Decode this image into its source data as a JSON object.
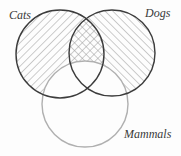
{
  "diagram": {
    "type": "venn",
    "sets": [
      {
        "id": "cats",
        "label": "Cats",
        "cx": 60,
        "cy": 54,
        "r": 44,
        "stroke": "#3c3c3c",
        "hatch": "backslash"
      },
      {
        "id": "dogs",
        "label": "Dogs",
        "cx": 112,
        "cy": 53,
        "r": 43,
        "stroke": "#3c3c3c",
        "hatch": "slash"
      },
      {
        "id": "mammals",
        "label": "Mammals",
        "cx": 85,
        "cy": 104,
        "r": 43,
        "stroke": "#b0b0b0",
        "hatch": "none"
      }
    ],
    "hatch_color": "#9a9a9a",
    "shaded_note": "Cats and Dogs regions outside Mammals are hatched; Cats∩Dogs outside Mammals is cross-hatched"
  },
  "labels": {
    "cats": "Cats",
    "dogs": "Dogs",
    "mammals": "Mammals"
  }
}
